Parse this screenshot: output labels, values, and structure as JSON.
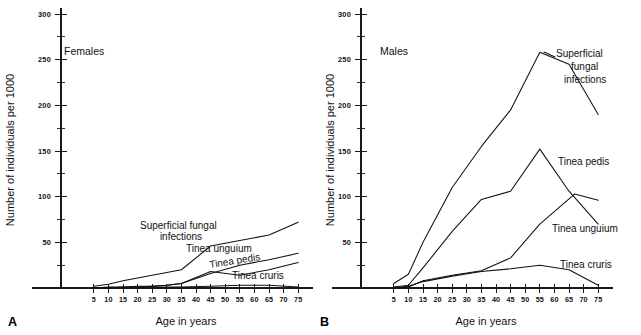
{
  "figure": {
    "background": "#ffffff",
    "ink_color": "#111111"
  },
  "panels": [
    {
      "letter": "A",
      "sex_label": "Females",
      "xlabel": "Age in years",
      "ylabel": "Number of individuals per 1000"
    },
    {
      "letter": "B",
      "sex_label": "Males",
      "xlabel": "Age in years",
      "ylabel": "Number of individuals per 1000"
    }
  ],
  "labels": {
    "females_superficial_line1": "Superficial fungal",
    "females_superficial_line2": "infections",
    "females_unguium": "Tinea unguium",
    "females_pedis": "Tinea pedis",
    "females_cruris": "Tinea cruris",
    "males_superficial_line1": "Superficial",
    "males_superficial_line2": "fungal",
    "males_superficial_line3": "infections",
    "males_pedis": "Tinea pedis",
    "males_unguium": "Tinea unguium",
    "males_cruris": "Tinea cruris"
  },
  "chart_data": [
    {
      "type": "line",
      "title": "Females",
      "panel": "A",
      "xlabel": "Age in years",
      "ylabel": "Number of individuals per 1000",
      "xlim": [
        0,
        78
      ],
      "ylim": [
        0,
        310
      ],
      "yticks": [
        50,
        100,
        150,
        200,
        250,
        300
      ],
      "ytick_labels": [
        "50",
        "100",
        "150",
        "200",
        "250",
        "300"
      ],
      "yticks_minor": [
        25,
        75,
        125,
        175,
        225,
        275
      ],
      "xticks": [
        5,
        10,
        15,
        20,
        25,
        30,
        35,
        40,
        45,
        50,
        55,
        60,
        65,
        70,
        75
      ],
      "xtick_labels": [
        "5",
        "10",
        "15",
        "20",
        "25",
        "30",
        "35",
        "40",
        "45",
        "50",
        "55",
        "60",
        "65",
        "70",
        "75"
      ],
      "grid": false,
      "legend": "inline-annotations",
      "series": [
        {
          "name": "Superficial fungal infections",
          "x": [
            5,
            10,
            15,
            20,
            25,
            30,
            35,
            45,
            55,
            65,
            75
          ],
          "values": [
            2,
            4,
            8,
            11,
            14,
            17,
            20,
            46,
            52,
            58,
            72
          ]
        },
        {
          "name": "Tinea unguium",
          "x": [
            5,
            10,
            15,
            20,
            25,
            30,
            35,
            45,
            55,
            65,
            75
          ],
          "values": [
            0,
            0,
            1,
            1,
            2,
            3,
            5,
            16,
            25,
            31,
            38
          ]
        },
        {
          "name": "Tinea pedis",
          "x": [
            5,
            10,
            15,
            20,
            25,
            30,
            35,
            45,
            55,
            65,
            75
          ],
          "values": [
            0,
            1,
            1,
            2,
            2,
            3,
            5,
            18,
            14,
            20,
            28
          ]
        },
        {
          "name": "Tinea cruris",
          "x": [
            5,
            10,
            15,
            20,
            25,
            30,
            35,
            45,
            55,
            65,
            75
          ],
          "values": [
            0,
            0,
            0,
            1,
            1,
            1,
            1,
            2,
            3,
            3,
            1
          ]
        }
      ]
    },
    {
      "type": "line",
      "title": "Males",
      "panel": "B",
      "xlabel": "Age in years",
      "ylabel": "Number of individuals per 1000",
      "xlim": [
        0,
        78
      ],
      "ylim": [
        0,
        310
      ],
      "yticks": [
        50,
        100,
        150,
        200,
        250,
        300
      ],
      "ytick_labels": [
        "50",
        "100",
        "150",
        "200",
        "250",
        "300"
      ],
      "yticks_minor": [
        25,
        75,
        125,
        175,
        225,
        275
      ],
      "xticks": [
        5,
        10,
        15,
        20,
        25,
        30,
        35,
        40,
        45,
        50,
        55,
        60,
        65,
        70,
        75
      ],
      "xtick_labels": [
        "5",
        "10",
        "15",
        "20",
        "25",
        "30",
        "35",
        "40",
        "45",
        "50",
        "55",
        "60",
        "65",
        "70",
        "75"
      ],
      "grid": false,
      "legend": "inline-annotations",
      "series": [
        {
          "name": "Superficial fungal infections",
          "x": [
            5,
            10,
            15,
            25,
            35,
            45,
            55,
            65,
            75
          ],
          "values": [
            5,
            15,
            50,
            110,
            155,
            195,
            258,
            245,
            190
          ]
        },
        {
          "name": "Tinea pedis",
          "x": [
            5,
            10,
            15,
            25,
            35,
            45,
            55,
            65,
            75
          ],
          "values": [
            1,
            3,
            22,
            62,
            97,
            106,
            152,
            106,
            70
          ]
        },
        {
          "name": "Tinea unguium",
          "x": [
            5,
            10,
            15,
            25,
            35,
            45,
            55,
            67,
            75
          ],
          "values": [
            0,
            1,
            8,
            14,
            19,
            33,
            70,
            103,
            96
          ]
        },
        {
          "name": "Tinea cruris",
          "x": [
            5,
            10,
            15,
            25,
            35,
            45,
            55,
            65,
            75
          ],
          "values": [
            0,
            2,
            7,
            13,
            18,
            21,
            25,
            20,
            3
          ]
        }
      ]
    }
  ]
}
